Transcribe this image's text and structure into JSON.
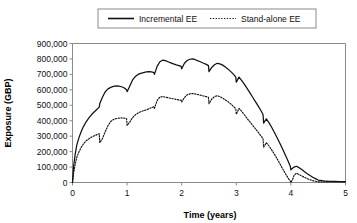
{
  "chart_data": {
    "type": "line",
    "title": "",
    "xlabel": "Time (years)",
    "ylabel": "Exposure (GBP)",
    "xlim": [
      0,
      5
    ],
    "ylim": [
      0,
      900000
    ],
    "xticks": [
      0,
      1,
      2,
      3,
      4,
      5
    ],
    "xtick_labels": [
      "0",
      "1",
      "2",
      "3",
      "4",
      "5"
    ],
    "yticks": [
      0,
      100000,
      200000,
      300000,
      400000,
      500000,
      600000,
      700000,
      800000,
      900000
    ],
    "ytick_labels": [
      "0",
      "100,000",
      "200,000",
      "300,000",
      "400,000",
      "500,000",
      "600,000",
      "700,000",
      "800,000",
      "900,000"
    ],
    "grid": false,
    "legend_position": "top-center",
    "legend_entries": [
      {
        "label": "Incremental EE",
        "style": "solid",
        "color": "#111111"
      },
      {
        "label": "Stand-alone EE",
        "style": "dotted",
        "color": "#111111"
      }
    ],
    "series": [
      {
        "name": "Incremental EE",
        "style": "solid",
        "color": "#111111",
        "x": [
          0.0,
          0.02,
          0.05,
          0.08,
          0.12,
          0.16,
          0.2,
          0.25,
          0.3,
          0.35,
          0.4,
          0.45,
          0.49,
          0.5,
          0.55,
          0.6,
          0.65,
          0.7,
          0.75,
          0.8,
          0.85,
          0.9,
          0.95,
          0.99,
          1.0,
          1.05,
          1.1,
          1.15,
          1.2,
          1.25,
          1.3,
          1.35,
          1.4,
          1.45,
          1.49,
          1.5,
          1.55,
          1.6,
          1.65,
          1.7,
          1.75,
          1.8,
          1.85,
          1.9,
          1.95,
          1.99,
          2.0,
          2.05,
          2.1,
          2.15,
          2.2,
          2.25,
          2.3,
          2.35,
          2.4,
          2.45,
          2.49,
          2.5,
          2.55,
          2.6,
          2.65,
          2.7,
          2.75,
          2.8,
          2.85,
          2.9,
          2.95,
          2.99,
          3.0,
          3.05,
          3.1,
          3.15,
          3.2,
          3.25,
          3.3,
          3.35,
          3.4,
          3.45,
          3.49,
          3.5,
          3.55,
          3.6,
          3.65,
          3.7,
          3.75,
          3.8,
          3.85,
          3.9,
          3.95,
          3.99,
          4.0,
          4.03,
          4.06,
          4.1,
          4.15,
          4.2,
          4.25,
          4.3,
          4.35,
          4.4,
          4.45,
          4.5,
          4.6,
          4.7,
          4.8,
          4.9,
          5.0
        ],
        "y": [
          0,
          60000,
          120000,
          165000,
          200000,
          228000,
          250000,
          270000,
          283000,
          294000,
          303000,
          310000,
          316000,
          258000,
          285000,
          330000,
          368000,
          395000,
          408000,
          414000,
          417000,
          418000,
          417000,
          414000,
          370000,
          392000,
          420000,
          438000,
          450000,
          458000,
          465000,
          470000,
          478000,
          485000,
          490000,
          480000,
          530000,
          553000,
          556000,
          553000,
          549000,
          545000,
          542000,
          538000,
          535000,
          532000,
          521000,
          550000,
          568000,
          574000,
          576000,
          573000,
          569000,
          565000,
          560000,
          556000,
          551000,
          510000,
          540000,
          556000,
          562000,
          556000,
          546000,
          535000,
          523000,
          508000,
          492000,
          478000,
          442000,
          480000,
          460000,
          437000,
          414000,
          392000,
          370000,
          348000,
          326000,
          302000,
          283000,
          228000,
          258000,
          236000,
          210000,
          182000,
          152000,
          120000,
          88000,
          57000,
          28000,
          8000,
          -12000,
          20000,
          48000,
          60000,
          52000,
          42000,
          33000,
          25000,
          18000,
          12000,
          8000,
          4000,
          4000,
          4000,
          4000,
          4000,
          4000
        ]
      },
      {
        "name": "Stand-alone EE",
        "style": "dotted",
        "color": "#111111",
        "x": [
          0.0,
          0.02,
          0.05,
          0.08,
          0.12,
          0.16,
          0.2,
          0.25,
          0.3,
          0.35,
          0.4,
          0.45,
          0.49,
          0.5,
          0.55,
          0.6,
          0.65,
          0.7,
          0.75,
          0.8,
          0.85,
          0.9,
          0.95,
          0.99,
          1.0,
          1.05,
          1.1,
          1.15,
          1.2,
          1.25,
          1.3,
          1.35,
          1.4,
          1.45,
          1.49,
          1.5,
          1.55,
          1.6,
          1.65,
          1.7,
          1.75,
          1.8,
          1.85,
          1.9,
          1.95,
          1.99,
          2.0,
          2.05,
          2.1,
          2.15,
          2.2,
          2.25,
          2.3,
          2.35,
          2.4,
          2.45,
          2.49,
          2.5,
          2.55,
          2.6,
          2.65,
          2.7,
          2.75,
          2.8,
          2.85,
          2.9,
          2.95,
          2.99,
          3.0,
          3.05,
          3.1,
          3.15,
          3.2,
          3.25,
          3.3,
          3.35,
          3.4,
          3.45,
          3.49,
          3.5,
          3.55,
          3.6,
          3.65,
          3.7,
          3.75,
          3.8,
          3.85,
          3.9,
          3.95,
          3.99,
          4.0,
          4.03,
          4.06,
          4.1,
          4.15,
          4.2,
          4.25,
          4.3,
          4.35,
          4.4,
          4.45,
          4.5,
          4.6,
          4.7,
          4.8,
          4.9,
          5.0
        ],
        "y": [
          0,
          105000,
          185000,
          245000,
          292000,
          330000,
          362000,
          393000,
          418000,
          440000,
          458000,
          474000,
          488000,
          512000,
          553000,
          588000,
          606000,
          616000,
          622000,
          625000,
          624000,
          620000,
          612000,
          600000,
          588000,
          625000,
          664000,
          686000,
          700000,
          707000,
          712000,
          716000,
          718000,
          716000,
          712000,
          700000,
          752000,
          782000,
          792000,
          789000,
          782000,
          775000,
          768000,
          762000,
          757000,
          752000,
          736000,
          772000,
          790000,
          798000,
          800000,
          795000,
          788000,
          780000,
          772000,
          765000,
          757000,
          718000,
          745000,
          762000,
          772000,
          768000,
          760000,
          748000,
          734000,
          718000,
          700000,
          682000,
          650000,
          682000,
          660000,
          635000,
          608000,
          580000,
          552000,
          524000,
          496000,
          466000,
          440000,
          385000,
          412000,
          386000,
          356000,
          322000,
          288000,
          252000,
          215000,
          176000,
          138000,
          104000,
          82000,
          92000,
          100000,
          105000,
          96000,
          84000,
          70000,
          57000,
          45000,
          34000,
          25000,
          16000,
          10000,
          8000,
          7000,
          6000,
          6000
        ]
      }
    ]
  }
}
